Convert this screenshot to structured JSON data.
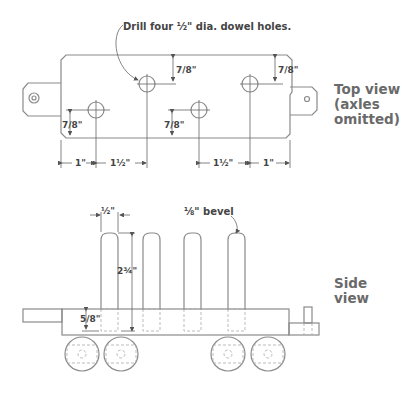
{
  "top_view": {
    "label_line1": "Top view",
    "label_line2": "(axles",
    "label_line3": "omitted)",
    "callout": "Drill four ½\" dia. dowel holes.",
    "dims": {
      "left_end": "1\"",
      "left_spacing": "1½\"",
      "right_spacing": "1½\"",
      "right_end": "1\"",
      "hole_offset": "7/8\""
    }
  },
  "side_view": {
    "label": "Side view",
    "callout": "⅛\" bevel",
    "dims": {
      "dowel_dia": "½\"",
      "dowel_height": "2¾\"",
      "hole_depth": "5/8\""
    }
  },
  "colors": {
    "line": "#8a8a8a",
    "text": "#444444",
    "label": "#6a6a6a"
  }
}
